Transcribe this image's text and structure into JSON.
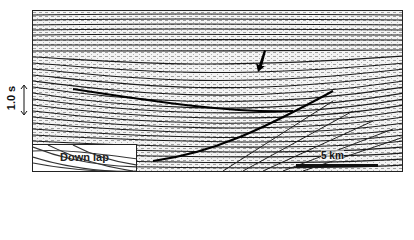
{
  "figure": {
    "type": "seismic-section",
    "colors": {
      "trace": "#1a1a1a",
      "background": "#f4f4f4",
      "border": "#222222"
    }
  },
  "vertical_scale": {
    "label": "1.0 s",
    "icon": "double-arrow-vertical"
  },
  "horizontal_scale": {
    "label": "5 km"
  },
  "inset": {
    "label": "Down lap"
  },
  "annotation": {
    "icon": "black-arrow-pointer"
  }
}
